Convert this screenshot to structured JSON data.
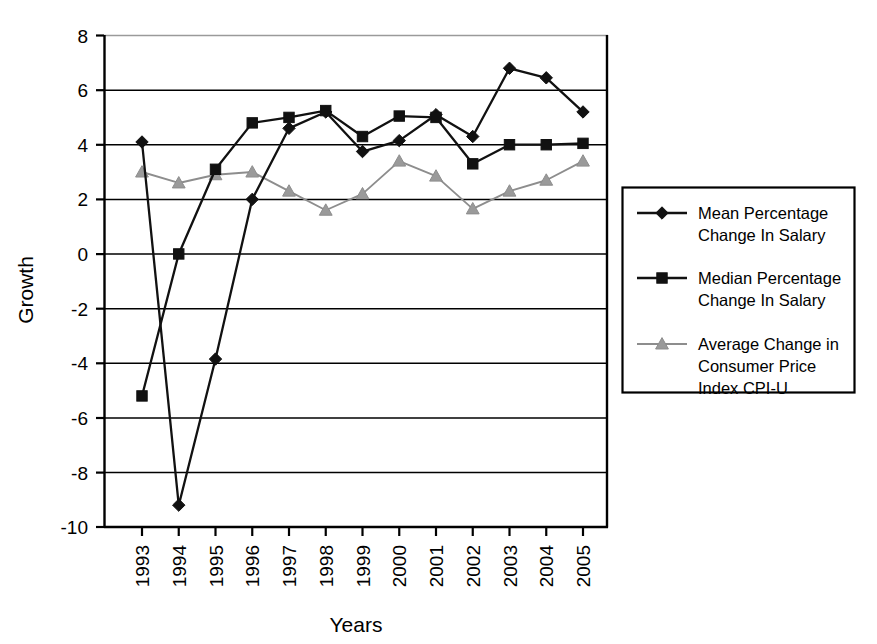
{
  "chart_data": {
    "type": "line",
    "title": "",
    "xlabel": "Years",
    "ylabel": "Growth",
    "categories": [
      "1993",
      "1994",
      "1995",
      "1996",
      "1997",
      "1998",
      "1999",
      "2000",
      "2001",
      "2002",
      "2003",
      "2004",
      "2005"
    ],
    "x": [
      1993,
      1994,
      1995,
      1996,
      1997,
      1998,
      1999,
      2000,
      2001,
      2002,
      2003,
      2004,
      2005
    ],
    "ylim": [
      -10,
      8
    ],
    "yticks": [
      8,
      6,
      4,
      2,
      0,
      -2,
      -4,
      -6,
      -8,
      -10
    ],
    "ytick_labels": [
      "8",
      "6",
      "4",
      "2",
      "0",
      "-2",
      "-4",
      "-6",
      "-8",
      "-10"
    ],
    "grid": "horizontal",
    "legend_position": "right",
    "series": [
      {
        "name": "Mean Percentage Change In Salary",
        "marker": "diamond",
        "color": "#111111",
        "values": [
          4.1,
          -9.2,
          -3.85,
          2.0,
          4.6,
          5.2,
          3.75,
          4.15,
          5.1,
          4.3,
          6.8,
          6.45,
          5.2
        ]
      },
      {
        "name": "Median Percentage Change In Salary",
        "marker": "square",
        "color": "#111111",
        "values": [
          -5.2,
          0.0,
          3.1,
          4.8,
          5.0,
          5.25,
          4.3,
          5.05,
          5.0,
          3.3,
          4.0,
          4.0,
          4.05
        ]
      },
      {
        "name": "Average Change in Consumer Price Index CPI-U",
        "marker": "triangle",
        "color": "#9a9a9a",
        "values": [
          3.0,
          2.6,
          2.9,
          3.0,
          2.3,
          1.6,
          2.2,
          3.4,
          2.85,
          1.65,
          2.3,
          2.7,
          3.4
        ]
      }
    ]
  },
  "axes": {
    "y_title": "Growth",
    "x_title": "Years",
    "y_tick_labels": [
      "8",
      "6",
      "4",
      "2",
      "0",
      "-2",
      "-4",
      "-6",
      "-8",
      "-10"
    ],
    "x_tick_labels": [
      "1993",
      "1994",
      "1995",
      "1996",
      "1997",
      "1998",
      "1999",
      "2000",
      "2001",
      "2002",
      "2003",
      "2004",
      "2005"
    ]
  },
  "legend": {
    "entries": [
      {
        "line1": "Mean Percentage",
        "line2": "Change In Salary",
        "line3": "",
        "marker": "diamond-marker-icon",
        "color": "#111111"
      },
      {
        "line1": "Median Percentage",
        "line2": "Change In Salary",
        "line3": "",
        "marker": "square-marker-icon",
        "color": "#111111"
      },
      {
        "line1": "Average Change in",
        "line2": "Consumer Price",
        "line3": "Index CPI-U",
        "marker": "triangle-marker-icon",
        "color": "#9a9a9a"
      }
    ]
  }
}
